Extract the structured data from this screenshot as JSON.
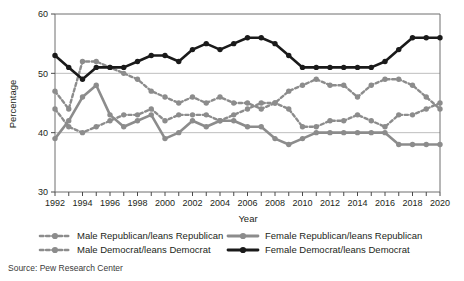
{
  "chart_data": {
    "type": "line",
    "title": "",
    "xlabel": "Year",
    "ylabel": "Percentage",
    "xlim": [
      1992,
      2020
    ],
    "ylim": [
      30,
      60
    ],
    "yticks": [
      30,
      40,
      50,
      60
    ],
    "ytick_labels": [
      "30",
      "40",
      "50",
      "60"
    ],
    "xticks": [
      1992,
      1993,
      1994,
      1995,
      1996,
      1997,
      1998,
      1999,
      2000,
      2001,
      2002,
      2003,
      2004,
      2005,
      2006,
      2007,
      2008,
      2009,
      2010,
      2011,
      2012,
      2013,
      2014,
      2015,
      2016,
      2017,
      2018,
      2019,
      2020
    ],
    "xtick_labels": [
      "1992",
      "1994",
      "1996",
      "1998",
      "2000",
      "2002",
      "2004",
      "2006",
      "2008",
      "2010",
      "2012",
      "2014",
      "2016",
      "2018",
      "2020"
    ],
    "xtick_label_years": [
      1992,
      1994,
      1996,
      1998,
      2000,
      2002,
      2004,
      2006,
      2008,
      2010,
      2012,
      2014,
      2016,
      2018,
      2020
    ],
    "grid": "horizontal",
    "legend_position": "bottom",
    "x": [
      1992,
      1993,
      1994,
      1995,
      1996,
      1997,
      1998,
      1999,
      2000,
      2001,
      2002,
      2003,
      2004,
      2005,
      2006,
      2007,
      2008,
      2009,
      2010,
      2011,
      2012,
      2013,
      2014,
      2015,
      2016,
      2017,
      2018,
      2019,
      2020
    ],
    "series": [
      {
        "name": "Male Republican/leans Republican",
        "style": "dashed",
        "color": "#8c8c8c",
        "values": [
          47,
          44,
          52,
          52,
          51,
          50,
          49,
          47,
          46,
          45,
          46,
          45,
          46,
          45,
          45,
          44,
          45,
          47,
          48,
          49,
          48,
          48,
          46,
          48,
          49,
          49,
          48,
          46,
          44
        ]
      },
      {
        "name": "Male Democrat/leans Democrat",
        "style": "dashed",
        "color": "#8c8c8c",
        "values": [
          44,
          41,
          40,
          41,
          42,
          43,
          43,
          44,
          42,
          43,
          43,
          43,
          42,
          43,
          44,
          45,
          45,
          44,
          41,
          41,
          42,
          42,
          43,
          42,
          41,
          43,
          43,
          44,
          45
        ]
      },
      {
        "name": "Female Republican/leans Republican",
        "style": "solid",
        "color": "#8c8c8c",
        "values": [
          39,
          42,
          46,
          48,
          43,
          41,
          42,
          43,
          39,
          40,
          42,
          41,
          42,
          42,
          41,
          41,
          39,
          38,
          39,
          40,
          40,
          40,
          40,
          40,
          40,
          38,
          38,
          38,
          38
        ]
      },
      {
        "name": "Female Democrat/leans Democrat",
        "style": "solid",
        "color": "#1a1a1a",
        "values": [
          53,
          51,
          49,
          51,
          51,
          51,
          52,
          53,
          53,
          52,
          54,
          55,
          54,
          55,
          56,
          56,
          55,
          53,
          51,
          51,
          51,
          51,
          51,
          51,
          52,
          54,
          56,
          56,
          56
        ]
      }
    ]
  },
  "legend": {
    "entries": [
      {
        "label": "Male Republican/leans Republican",
        "style": "dashed",
        "color": "#8c8c8c"
      },
      {
        "label": "Male Democrat/leans Democrat",
        "style": "dashed",
        "color": "#8c8c8c"
      },
      {
        "label": "Female Republican/leans Republican",
        "style": "solid",
        "color": "#8c8c8c"
      },
      {
        "label": "Female Democrat/leans Democrat",
        "style": "solid",
        "color": "#1a1a1a"
      }
    ]
  },
  "source": {
    "text": "Source: Pew Research Center"
  }
}
